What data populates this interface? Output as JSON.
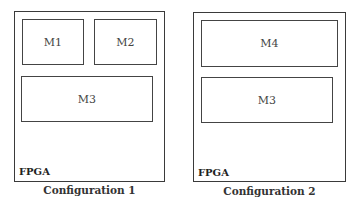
{
  "configurations": [
    {
      "caption": "Configuration 1",
      "fpga_label": "FPGA",
      "modules": [
        "M1",
        "M2",
        "M3"
      ]
    },
    {
      "caption": "Configuration 2",
      "fpga_label": "FPGA",
      "modules": [
        "M4",
        "M3"
      ]
    }
  ]
}
